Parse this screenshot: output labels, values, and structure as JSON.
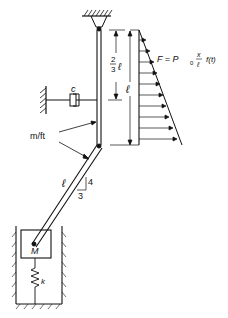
{
  "diagram": {
    "type": "mechanical-system",
    "labels": {
      "damper": "c",
      "mass_per_length": "m/ft",
      "upper_length_frac_num": "2",
      "upper_length_frac_den": "3",
      "upper_length_sym": "ℓ",
      "total_length": "ℓ",
      "lower_length": "ℓ",
      "slope_rise": "4",
      "slope_run": "3",
      "mass": "M",
      "spring": "k",
      "force_lhs": "F = P",
      "force_sub": "0",
      "force_frac_num": "x",
      "force_frac_den": "ℓ",
      "force_rhs": "f(t)"
    },
    "colors": {
      "line": "#111111",
      "background": "#ffffff"
    }
  }
}
